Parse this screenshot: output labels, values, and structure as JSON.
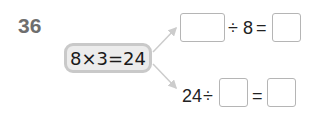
{
  "problem": {
    "number": "36",
    "given_equation": "8×3=24",
    "division_1": {
      "blank_1": "",
      "operator": "÷",
      "divisor": "8",
      "equals": "=",
      "blank_answer": ""
    },
    "division_2": {
      "dividend": "24",
      "operator": "÷",
      "blank_divisor": "",
      "equals": "=",
      "blank_answer": ""
    }
  },
  "colors": {
    "number": "#6e6e6e",
    "given_box_bg": "#ececec",
    "given_box_border": "#c9c9c9",
    "arrow": "#cccccc",
    "blank_border": "#b5b5b5"
  }
}
